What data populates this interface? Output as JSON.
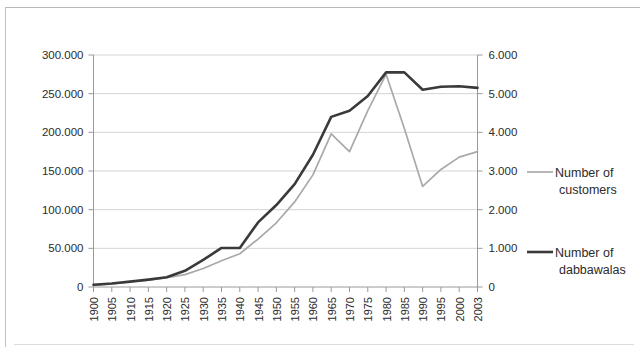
{
  "chart_data": {
    "type": "line",
    "title": "",
    "xlabel": "",
    "ylabel": "",
    "grid": true,
    "legend_position": "right",
    "categories": [
      "1900",
      "1905",
      "1910",
      "1915",
      "1920",
      "1925",
      "1930",
      "1935",
      "1940",
      "1945",
      "1950",
      "1955",
      "1960",
      "1965",
      "1970",
      "1975",
      "1980",
      "1985",
      "1990",
      "1995",
      "2000",
      "2003"
    ],
    "left_axis": {
      "name": "Number of customers",
      "ticks": [
        "0",
        "50.000",
        "100.000",
        "150.000",
        "200.000",
        "250.000",
        "300.000"
      ],
      "tick_values": [
        0,
        50000,
        100000,
        150000,
        200000,
        250000,
        300000
      ],
      "ylim": [
        0,
        300000
      ]
    },
    "right_axis": {
      "name": "Number of dabbawalas",
      "ticks": [
        "0",
        "1.000",
        "2.000",
        "3.000",
        "4.000",
        "5.000",
        "6.000"
      ],
      "tick_values": [
        0,
        1000,
        2000,
        3000,
        4000,
        5000,
        6000
      ],
      "ylim": [
        0,
        6000
      ]
    },
    "series": [
      {
        "name": "Number of customers",
        "axis": "left",
        "color": "#a9a9a9",
        "values": [
          2000,
          4000,
          7000,
          9000,
          12000,
          16000,
          24000,
          34000,
          43000,
          62000,
          83000,
          110000,
          145000,
          198000,
          175000,
          228000,
          275000,
          205000,
          130000,
          152000,
          168000,
          175000
        ]
      },
      {
        "name": "Number of dabbawalas",
        "axis": "right",
        "color": "#3a3a3a",
        "values": [
          60,
          90,
          140,
          190,
          250,
          420,
          700,
          1010,
          1010,
          1670,
          2120,
          2660,
          3420,
          4400,
          4560,
          4940,
          5550,
          5550,
          5100,
          5180,
          5190,
          5150
        ]
      }
    ],
    "legend": [
      {
        "label_line1": "Number of",
        "label_line2": "customers",
        "color": "#a9a9a9"
      },
      {
        "label_line1": "Number of",
        "label_line2": "dabbawalas",
        "color": "#3a3a3a"
      }
    ]
  }
}
